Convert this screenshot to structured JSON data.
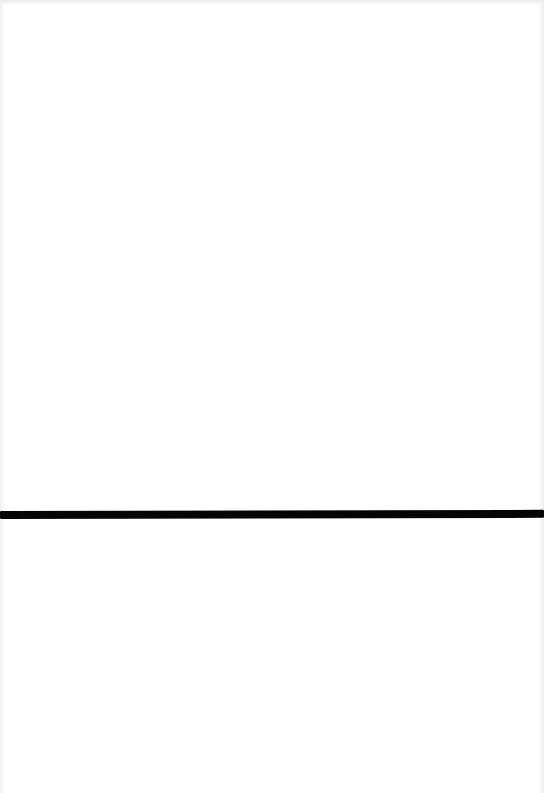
{
  "page": {
    "type": "scanned-page",
    "background_color": "#ffffff",
    "text_content": []
  },
  "rule": {
    "color": "#050505",
    "thickness_px": 8,
    "y_px": 511
  }
}
